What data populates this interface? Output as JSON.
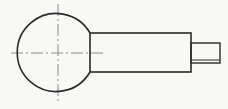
{
  "diagram": {
    "type": "technical-drawing",
    "colors": {
      "line": "#2a2a2a",
      "centerline": "#8a8a8a",
      "background": "#f8f8f6"
    },
    "ball": {
      "cx": 58,
      "cy": 53,
      "r": 39
    },
    "shaft": {
      "x": 90,
      "y": 33,
      "width": 101,
      "height": 39
    },
    "pin": {
      "x": 191,
      "y": 43,
      "width": 29,
      "height": 20,
      "inner_line_y": 60
    },
    "centerlines": {
      "h": {
        "x1": 11,
        "x2": 105,
        "y": 53
      },
      "v": {
        "x": 58,
        "y1": 4,
        "y2": 102
      }
    }
  }
}
